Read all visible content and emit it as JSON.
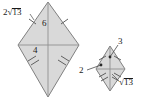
{
  "figure": {
    "name": "two-similar-kites-diagram",
    "background_color": "#ffffff",
    "shape_fill": "#d9d9d9",
    "shape_stroke": "#808080",
    "label_color": "#1a1a1a"
  },
  "labels": {
    "left_side_long": "2",
    "left_side_long_radicand": "13",
    "left_vertical_upper": "6",
    "left_horizontal_half": "4",
    "right_vertical_upper": "3",
    "right_horizontal_half": "2",
    "right_side_long_radicand": "13",
    "radical_sign": "√"
  },
  "shapes": [
    {
      "name": "large-kite",
      "top_apex": [
        48,
        2
      ],
      "left_vertex": [
        18,
        45
      ],
      "right_vertex": [
        79,
        45
      ],
      "bottom_apex": [
        48,
        97
      ],
      "tick_marks_upper": 1,
      "tick_marks_lower": 2
    },
    {
      "name": "small-kite",
      "top_apex": [
        110,
        46
      ],
      "left_vertex": [
        96,
        69
      ],
      "right_vertex": [
        125,
        69
      ],
      "bottom_apex": [
        110,
        91
      ],
      "tick_marks_upper": 1,
      "tick_marks_lower": 2
    }
  ]
}
